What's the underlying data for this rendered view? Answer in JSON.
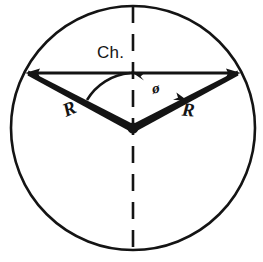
{
  "figure": {
    "kind": "geometry-diagram",
    "background_color": "#ffffff",
    "stroke_color": "#141414"
  },
  "labels": {
    "chord": "Ch.",
    "radius_left": "R",
    "radius_right": "R",
    "angle": "ø"
  },
  "geometry": {
    "canvas": {
      "width": 263,
      "height": 262
    },
    "circle": {
      "cx": 133,
      "cy": 128,
      "r": 122,
      "stroke_width": 2.6
    },
    "center_dot": {
      "cx": 133,
      "cy": 128,
      "r": 5.5
    },
    "chord": {
      "x1": 26,
      "y1": 73,
      "x2": 240,
      "y2": 73,
      "stroke_width": 2.8,
      "arrowheads": "both"
    },
    "centerline": {
      "x1": 133,
      "y1": 6,
      "x2": 133,
      "y2": 250,
      "stroke_width": 2.6,
      "dash": "17 11"
    },
    "radius_left": {
      "x1": 133,
      "y1": 128,
      "x2": 28,
      "y2": 73,
      "taper": true
    },
    "radius_right": {
      "x1": 133,
      "y1": 128,
      "x2": 238,
      "y2": 73,
      "taper": true
    },
    "angle_arc": {
      "cx": 133,
      "cy": 128,
      "radius": 56,
      "start_deg": 270,
      "end_deg": 332,
      "stroke_width": 2.4,
      "arrowheads": "both"
    }
  }
}
